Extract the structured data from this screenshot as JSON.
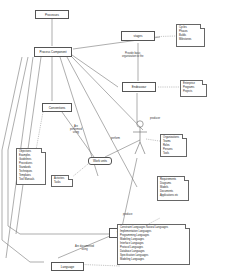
{
  "diagram": {
    "nodes": {
      "processes": "Processes",
      "process_component": "Process Component",
      "stages": "stages",
      "endeavour": "Endeavour",
      "conventions": "Conventions",
      "work_units": "Work units",
      "work_product": "Work product",
      "language": "Language",
      "producer": "producer"
    },
    "notes": {
      "stages": [
        "Cycles",
        "Phases",
        "Builds",
        "Milestones"
      ],
      "endeavour": [
        "Enterprise",
        "Programs",
        "Projects"
      ],
      "conventions": [
        "Objectives",
        "Examples",
        "Guidelines",
        "Procedures",
        "Standards",
        "Techniques",
        "Templates",
        "Tool Manuals"
      ],
      "work_units": [
        "Activities",
        "Tasks"
      ],
      "producer": [
        "Organizations",
        "Teams",
        "Roles",
        "Persons",
        "Tools"
      ],
      "work_product": [
        "Requirements",
        "Diagrams",
        "Models",
        "Documents",
        "Applications etc"
      ],
      "language": [
        "Constraint Languages Natural Languages",
        "Implementation Languages",
        "Programming Languages",
        "Modeling Languages",
        "Interface Languages",
        "Protocol Languages",
        "Database Languages",
        "Specification Languages",
        "Modeling Languages"
      ]
    },
    "edge_labels": {
      "provide_basic": "Provide basic\norganization to the",
      "are_performed_using": "Are\nperformed\nusing",
      "perform": "perform",
      "produce": "produce",
      "documented_using": "Are documented\nusing"
    }
  }
}
